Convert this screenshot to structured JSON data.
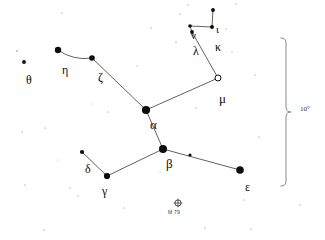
{
  "chart": {
    "type": "star-chart",
    "width": 325,
    "height": 240,
    "background_color": "#ffffff",
    "ink_color": "#0c0c0c",
    "line_color": "#3a3a3a"
  },
  "scale": {
    "label": "10°",
    "name": "scale-brace",
    "orientation": "vertical",
    "x": 286,
    "y_top": 38,
    "y_bottom": 186,
    "label_x": 300,
    "label_y": 106
  },
  "deep_sky_objects": [
    {
      "id": "m79",
      "label": "M 79",
      "symbol": "globular-cluster",
      "x": 178,
      "y": 203,
      "radius": 3.1,
      "label_x": 168,
      "label_y": 210
    }
  ],
  "stars": [
    {
      "id": "alpha",
      "label": "α",
      "x": 146,
      "y": 110,
      "r": 4.1,
      "filled": true,
      "label_x": 150,
      "label_y": 118,
      "size": 13
    },
    {
      "id": "beta",
      "label": "β",
      "x": 163,
      "y": 149,
      "r": 4.0,
      "filled": true,
      "label_x": 166,
      "label_y": 157,
      "size": 13
    },
    {
      "id": "gamma",
      "label": "γ",
      "x": 107,
      "y": 176,
      "r": 3.1,
      "filled": true,
      "label_x": 102,
      "label_y": 185,
      "size": 12
    },
    {
      "id": "delta",
      "label": "δ",
      "x": 82,
      "y": 152,
      "r": 2.1,
      "filled": true,
      "label_x": 85,
      "label_y": 163,
      "size": 12
    },
    {
      "id": "epsilon",
      "label": "ε",
      "x": 240,
      "y": 170,
      "r": 3.8,
      "filled": true,
      "label_x": 245,
      "label_y": 181,
      "size": 12
    },
    {
      "id": "zeta",
      "label": "ζ",
      "x": 92,
      "y": 58,
      "r": 2.8,
      "filled": true,
      "label_x": 98,
      "label_y": 71,
      "size": 12
    },
    {
      "id": "eta",
      "label": "η",
      "x": 58,
      "y": 50,
      "r": 3.2,
      "filled": true,
      "label_x": 62,
      "label_y": 64,
      "size": 12
    },
    {
      "id": "theta",
      "label": "θ",
      "x": 24,
      "y": 62,
      "r": 1.9,
      "filled": true,
      "label_x": 26,
      "label_y": 74,
      "size": 12
    },
    {
      "id": "iota",
      "label": "ι",
      "x": 213,
      "y": 10,
      "r": 1.9,
      "filled": true,
      "label_x": 216,
      "label_y": 24,
      "size": 11
    },
    {
      "id": "kappa",
      "label": "κ",
      "x": 212,
      "y": 27,
      "r": 2.0,
      "filled": true,
      "label_x": 215,
      "label_y": 41,
      "size": 12
    },
    {
      "id": "lambda",
      "label": "λ",
      "x": 192,
      "y": 32,
      "r": 1.9,
      "filled": true,
      "label_x": 193,
      "label_y": 45,
      "size": 12
    },
    {
      "id": "nu",
      "label": "ν",
      "x": 190,
      "y": 26,
      "r": 1.8,
      "filled": true,
      "label_x": 191,
      "label_y": 30,
      "size": 11
    },
    {
      "id": "mu",
      "label": "μ",
      "x": 218,
      "y": 78,
      "r": 3.0,
      "filled": false,
      "label_x": 219,
      "label_y": 92,
      "size": 13
    }
  ],
  "unlabeled_stars": [
    {
      "id": "beta-epsilon-midstar",
      "x": 190,
      "y": 155,
      "r": 1.6
    }
  ],
  "constellation_lines": [
    {
      "id": "eta-zeta",
      "from": "eta",
      "to": "zeta",
      "curved": true
    },
    {
      "id": "zeta-alpha",
      "from": "zeta",
      "to": "alpha",
      "curved": false
    },
    {
      "id": "alpha-mu",
      "from": "alpha",
      "to": "mu",
      "curved": false
    },
    {
      "id": "mu-lambda",
      "from": "mu",
      "to": "lambda",
      "curved": false
    },
    {
      "id": "lambda-nu",
      "from": "lambda",
      "to": "nu",
      "curved": false
    },
    {
      "id": "nu-kappa",
      "from": "nu",
      "to": "kappa",
      "curved": false
    },
    {
      "id": "kappa-iota",
      "from": "kappa",
      "to": "iota",
      "curved": false
    },
    {
      "id": "alpha-beta",
      "from": "alpha",
      "to": "beta",
      "curved": false
    },
    {
      "id": "beta-gamma",
      "from": "beta",
      "to": "gamma",
      "curved": false
    },
    {
      "id": "gamma-delta",
      "from": "gamma",
      "to": "delta",
      "curved": false
    },
    {
      "id": "beta-epsilon",
      "from": "beta",
      "to": "epsilon",
      "curved": false
    }
  ],
  "background_stars": [
    {
      "x": 17,
      "y": 51,
      "r": 0.7
    },
    {
      "x": 30,
      "y": 78,
      "r": 0.7
    },
    {
      "x": 62,
      "y": 13,
      "r": 0.5
    },
    {
      "x": 45,
      "y": 128,
      "r": 0.5
    },
    {
      "x": 22,
      "y": 132,
      "r": 0.6
    },
    {
      "x": 25,
      "y": 185,
      "r": 0.5
    },
    {
      "x": 44,
      "y": 230,
      "r": 0.6
    },
    {
      "x": 70,
      "y": 188,
      "r": 0.5
    },
    {
      "x": 78,
      "y": 196,
      "r": 0.5
    },
    {
      "x": 108,
      "y": 112,
      "r": 0.5
    },
    {
      "x": 124,
      "y": 208,
      "r": 0.5
    },
    {
      "x": 137,
      "y": 66,
      "r": 0.5
    },
    {
      "x": 151,
      "y": 28,
      "r": 0.5
    },
    {
      "x": 176,
      "y": 42,
      "r": 0.6
    },
    {
      "x": 180,
      "y": 14,
      "r": 0.5
    },
    {
      "x": 188,
      "y": 5,
      "r": 0.5
    },
    {
      "x": 196,
      "y": 108,
      "r": 0.5
    },
    {
      "x": 226,
      "y": 29,
      "r": 0.5
    },
    {
      "x": 232,
      "y": 52,
      "r": 0.5
    },
    {
      "x": 236,
      "y": 4,
      "r": 0.5
    },
    {
      "x": 255,
      "y": 75,
      "r": 0.5
    },
    {
      "x": 259,
      "y": 137,
      "r": 0.6
    },
    {
      "x": 244,
      "y": 200,
      "r": 0.5
    },
    {
      "x": 251,
      "y": 229,
      "r": 0.6
    },
    {
      "x": 205,
      "y": 228,
      "r": 0.5
    },
    {
      "x": 300,
      "y": 205,
      "r": 0.5
    },
    {
      "x": 160,
      "y": 172,
      "r": 0.4
    },
    {
      "x": 92,
      "y": 104,
      "r": 0.4
    },
    {
      "x": 58,
      "y": 160,
      "r": 0.4
    }
  ]
}
